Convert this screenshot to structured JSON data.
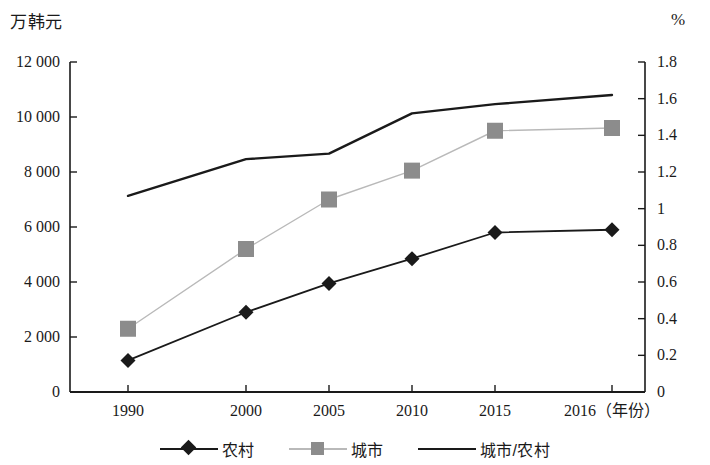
{
  "axes": {
    "left_unit": "万韩元",
    "right_unit": "%",
    "x_unit": "（年份）",
    "left_ticks": [
      "0",
      "2 000",
      "4 000",
      "6 000",
      "8 000",
      "10 000",
      "12 000"
    ],
    "right_ticks": [
      "0",
      "0.2",
      "0.4",
      "0.6",
      "0.8",
      "1",
      "1.2",
      "1.4",
      "1.6",
      "1.8"
    ]
  },
  "legend": {
    "items": [
      {
        "label": "农村",
        "marker": "diamond-marker",
        "color": "#1a1a1a"
      },
      {
        "label": "城市",
        "marker": "square-marker",
        "color": "#8c8c8c"
      },
      {
        "label": "城市/农村",
        "marker": "line-marker",
        "color": "#1a1a1a"
      }
    ]
  },
  "chart_data": {
    "type": "line",
    "title": "",
    "xlabel": "（年份）",
    "ylabel": "万韩元",
    "y2label": "%",
    "categories": [
      "1990",
      "2000",
      "2005",
      "2010",
      "2015",
      "2016"
    ],
    "x_tick_labels": [
      "1990",
      "2000",
      "2005",
      "2010",
      "2015",
      "2016（年份）"
    ],
    "ylim": [
      0,
      12000
    ],
    "y2lim": [
      0,
      1.8
    ],
    "yticks": [
      0,
      2000,
      4000,
      6000,
      8000,
      10000,
      12000
    ],
    "y2ticks": [
      0,
      0.2,
      0.4,
      0.6,
      0.8,
      1,
      1.2,
      1.4,
      1.6,
      1.8
    ],
    "grid": false,
    "legend_position": "bottom",
    "series": [
      {
        "name": "农村",
        "axis": "left",
        "marker": "diamond",
        "color": "#1a1a1a",
        "values": [
          1150,
          2900,
          3950,
          4850,
          5800,
          5900
        ]
      },
      {
        "name": "城市",
        "axis": "left",
        "marker": "square",
        "color": "#8c8c8c",
        "values": [
          2300,
          5200,
          7000,
          8050,
          9500,
          9600
        ]
      },
      {
        "name": "城市/农村",
        "axis": "right",
        "marker": "none",
        "color": "#1a1a1a",
        "values": [
          1.07,
          1.27,
          1.3,
          1.52,
          1.57,
          1.62
        ]
      }
    ]
  }
}
